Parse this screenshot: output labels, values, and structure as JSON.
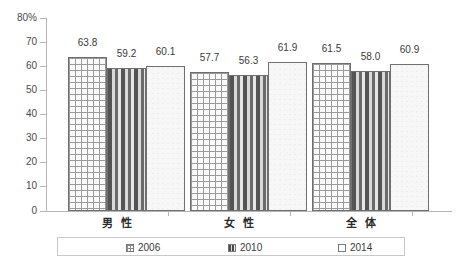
{
  "chart_data": {
    "type": "bar",
    "title": "",
    "xlabel": "",
    "ylabel": "",
    "ylim": [
      0,
      80
    ],
    "y_unit_label": "80%",
    "ytick_labels": [
      "80%",
      "70",
      "60",
      "50",
      "40",
      "30",
      "20",
      "10",
      "0"
    ],
    "ytick_values": [
      80,
      70,
      60,
      50,
      40,
      30,
      20,
      10,
      0
    ],
    "grid": false,
    "legend_position": "bottom",
    "categories": [
      "男 性",
      "女 性",
      "全 体"
    ],
    "series": [
      {
        "name": "2006",
        "pattern": "crosshatch-grid",
        "values": [
          63.8,
          59.2,
          61.5
        ]
      },
      {
        "name": "2010",
        "pattern": "vertical-stripe",
        "values": [
          59.2,
          56.3,
          58.0
        ]
      },
      {
        "name": "2014",
        "pattern": "plain-light",
        "values": [
          60.1,
          61.9,
          60.9
        ]
      }
    ],
    "groups": [
      {
        "category": "男 性",
        "bars": [
          {
            "series": "2006",
            "value": 63.8,
            "label": "63.8"
          },
          {
            "series": "2010",
            "value": 59.2,
            "label": "59.2"
          },
          {
            "series": "2014",
            "value": 60.1,
            "label": "60.1"
          }
        ]
      },
      {
        "category": "女 性",
        "bars": [
          {
            "series": "2006",
            "value": 57.7,
            "label": "57.7"
          },
          {
            "series": "2010",
            "value": 56.3,
            "label": "56.3"
          },
          {
            "series": "2014",
            "value": 61.9,
            "label": "61.9"
          }
        ]
      },
      {
        "category": "全 体",
        "bars": [
          {
            "series": "2006",
            "value": 61.5,
            "label": "61.5"
          },
          {
            "series": "2010",
            "value": 58.0,
            "label": "58.0"
          },
          {
            "series": "2014",
            "value": 60.9,
            "label": "60.9"
          }
        ]
      }
    ]
  },
  "legend": {
    "items": [
      {
        "label": "2006",
        "swatch": "crosshatch-grid-swatch"
      },
      {
        "label": "2010",
        "swatch": "vertical-stripe-swatch"
      },
      {
        "label": "2014",
        "swatch": "plain-light-swatch"
      }
    ]
  },
  "colors": {
    "axis": "#b6b6b6",
    "bar_border": "#6f6f6f",
    "text": "#3a3a3a",
    "legend_border": "#c9c9c9",
    "background": "#ffffff"
  }
}
